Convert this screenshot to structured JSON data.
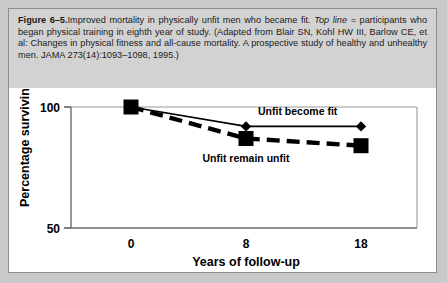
{
  "figure": {
    "number": "Figure 6–5.",
    "caption_main": "Improved mortality in physically unfit men who became fit.",
    "caption_emphasis": "Top line =",
    "caption_rest": " participants who began physical training in eighth year of study. (Adapted from Blair SN, Kohl HW III, Barlow CE, et al: Changes in physical fitness and all-cause mortality. A prospective study of healthy and unhealthy men. JAMA 273(14):1093–1098, 1995.)"
  },
  "chart_data": {
    "type": "line",
    "title": "",
    "xlabel": "Years of follow-up",
    "ylabel": "Percentage surviving",
    "x": [
      0,
      8,
      18
    ],
    "xtick_labels": [
      "0",
      "8",
      "18"
    ],
    "ytick_labels": [
      "50",
      "100"
    ],
    "yticks": [
      50,
      100
    ],
    "ylim": [
      50,
      100
    ],
    "xlim": [
      -3,
      22
    ],
    "grid": false,
    "legend": "inline-annotations",
    "series": [
      {
        "name": "Unfit become fit",
        "values": [
          100,
          92,
          92
        ],
        "marker": "diamond",
        "linestyle": "solid",
        "color": "#000000",
        "label_x": 11.5,
        "label_y": 95.5
      },
      {
        "name": "Unfit remain unfit",
        "values": [
          100,
          87,
          84
        ],
        "marker": "square",
        "linestyle": "dashed",
        "color": "#000000",
        "label_x": 10.5,
        "label_y": 80.5
      }
    ]
  },
  "colors": {
    "page_background": "#c9c9c9",
    "panel_background": "#ffffff",
    "caption_background": "#d2d2d2",
    "ink": "#000000",
    "frame": "#8d8d8d"
  }
}
